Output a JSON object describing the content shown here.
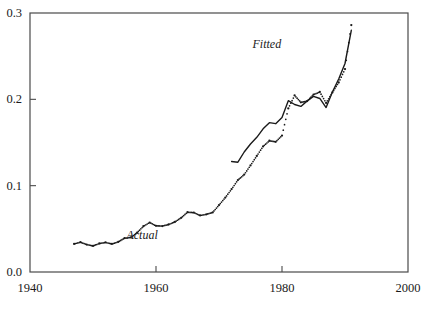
{
  "chart_data": {
    "type": "line",
    "title": "",
    "xlabel": "",
    "ylabel": "",
    "xlim": [
      1940,
      2000
    ],
    "ylim": [
      0.0,
      0.3
    ],
    "grid": false,
    "legend_position": "inline-annotation",
    "xticks": [
      "1940",
      "1960",
      "1980",
      "2000"
    ],
    "xtick_values": [
      1940,
      1960,
      1980,
      2000
    ],
    "yticks": [
      "0.0",
      "0.1",
      "0.2",
      "0.3"
    ],
    "ytick_values": [
      0.0,
      0.1,
      0.2,
      0.3
    ],
    "annotations": [
      {
        "text": "Actual",
        "x": 1957.8,
        "y": 0.0425
      },
      {
        "text": "Fitted",
        "x": 1977.6,
        "y": 0.2645
      }
    ],
    "series": [
      {
        "name": "Actual",
        "style": "dotted",
        "color": "#1a1a1a",
        "x": [
          1947,
          1948,
          1949,
          1950,
          1951,
          1952,
          1953,
          1954,
          1955,
          1956,
          1957,
          1958,
          1959,
          1960,
          1961,
          1962,
          1963,
          1964,
          1965,
          1966,
          1967,
          1968,
          1969,
          1970,
          1971,
          1972,
          1973,
          1974,
          1975,
          1976,
          1977,
          1978,
          1979,
          1980,
          1981,
          1982,
          1983,
          1984,
          1985,
          1986,
          1987,
          1988,
          1989,
          1990,
          1991
        ],
        "values": [
          0.0325,
          0.0345,
          0.0318,
          0.0302,
          0.033,
          0.0342,
          0.0325,
          0.0348,
          0.0392,
          0.04,
          0.0455,
          0.053,
          0.0573,
          0.0535,
          0.0532,
          0.055,
          0.058,
          0.0628,
          0.0692,
          0.0688,
          0.0655,
          0.0668,
          0.069,
          0.0775,
          0.0862,
          0.096,
          0.1065,
          0.1128,
          0.1235,
          0.1345,
          0.1455,
          0.152,
          0.1508,
          0.158,
          0.1895,
          0.2045,
          0.1965,
          0.198,
          0.2055,
          0.2085,
          0.1958,
          0.208,
          0.2195,
          0.235,
          0.286
        ],
        "note": "Dotted series spans 1947-1991"
      },
      {
        "name": "Fitted",
        "style": "solid",
        "color": "#1a1a1a",
        "x": [
          1972,
          1973,
          1974,
          1975,
          1976,
          1977,
          1978,
          1979,
          1980,
          1981,
          1982,
          1983,
          1984,
          1985,
          1986,
          1987,
          1988,
          1989,
          1990,
          1991
        ],
        "values": [
          0.128,
          0.1272,
          0.139,
          0.1482,
          0.156,
          0.1658,
          0.173,
          0.1718,
          0.179,
          0.1985,
          0.194,
          0.1918,
          0.1982,
          0.2035,
          0.201,
          0.1905,
          0.2085,
          0.2235,
          0.2415,
          0.28
        ],
        "note": "Solid series spans 1972-1991"
      }
    ]
  },
  "frame": {
    "left_px": 30,
    "right_px": 408,
    "top_px": 13,
    "bottom_px": 272,
    "border_color": "#4a4a4a"
  }
}
